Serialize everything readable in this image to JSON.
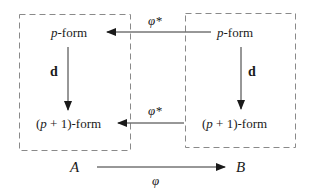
{
  "diagram": {
    "type": "commutative-diagram",
    "boxes": [
      {
        "id": "A",
        "label": "A",
        "style": "dashed"
      },
      {
        "id": "B",
        "label": "B",
        "style": "dashed"
      }
    ],
    "nodes": {
      "left_top": {
        "var": "p",
        "suffix": "-form"
      },
      "left_bottom": {
        "prefix": "(",
        "var": "p",
        "mid": " + 1)",
        "suffix": "-form"
      },
      "right_top": {
        "var": "p",
        "suffix": "-form"
      },
      "right_bottom": {
        "prefix": "(",
        "var": "p",
        "mid": " + 1)",
        "suffix": "-form"
      },
      "space_A": "A",
      "space_B": "B"
    },
    "arrows": {
      "pullback_top": {
        "label": "φ*",
        "from": "right_top",
        "to": "left_top"
      },
      "pullback_bottom": {
        "label": "φ*",
        "from": "right_bottom",
        "to": "left_bottom"
      },
      "d_left": {
        "label": "d",
        "from": "left_top",
        "to": "left_bottom"
      },
      "d_right": {
        "label": "d",
        "from": "right_top",
        "to": "right_bottom"
      },
      "phi_map": {
        "label": "φ",
        "from": "space_A",
        "to": "space_B"
      }
    },
    "colors": {
      "line": "#1a1a1a",
      "dashed_box": "#888888",
      "background": "#ffffff"
    }
  }
}
